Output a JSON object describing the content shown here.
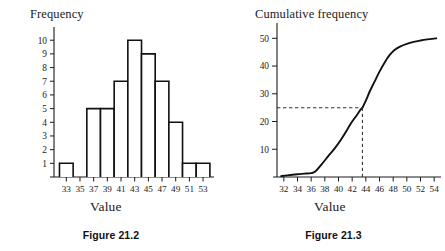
{
  "figures": [
    {
      "caption": "Figure 21.2",
      "chart_data": {
        "type": "bar",
        "title": "Frequency",
        "xlabel": "Value",
        "ylabel": "Frequency",
        "categories": [
          33,
          35,
          37,
          39,
          41,
          43,
          45,
          47,
          49,
          51,
          53
        ],
        "values": [
          1,
          0,
          5,
          5,
          7,
          10,
          9,
          7,
          4,
          1,
          1
        ],
        "xtick_labels": [
          "33",
          "35",
          "37",
          "39",
          "41",
          "43",
          "45",
          "47",
          "49",
          "51",
          "53"
        ],
        "ytick_labels": [
          "1",
          "2",
          "3",
          "4",
          "5",
          "6",
          "7",
          "8",
          "9",
          "10"
        ],
        "ytick_values": [
          1,
          2,
          3,
          4,
          5,
          6,
          7,
          8,
          9,
          10
        ],
        "xlim": [
          31.2,
          54.6
        ],
        "ylim": [
          0,
          10.6
        ],
        "bar_width": 2,
        "grid": false,
        "legend": false,
        "axis_color": "#1a1a1a",
        "bar_fill": "#ffffff",
        "bar_stroke": "#111111"
      }
    },
    {
      "caption": "Figure 21.3",
      "chart_data": {
        "type": "line",
        "title": "Cumulative frequency",
        "xlabel": "Value",
        "ylabel": "Cumulative frequency",
        "xtick_labels": [
          "32",
          "34",
          "36",
          "38",
          "40",
          "42",
          "44",
          "46",
          "48",
          "50",
          "52",
          "54"
        ],
        "xtick_values": [
          32,
          34,
          36,
          38,
          40,
          42,
          44,
          46,
          48,
          50,
          52,
          54
        ],
        "ytick_labels": [
          "10",
          "20",
          "30",
          "40",
          "50"
        ],
        "ytick_values": [
          10,
          20,
          30,
          40,
          50
        ],
        "xlim": [
          31.0,
          55.0
        ],
        "ylim": [
          0,
          53
        ],
        "grid": false,
        "legend": false,
        "axis_color": "#1a1a1a",
        "line_color": "#111111",
        "series": [
          {
            "name": "Cumulative frequency",
            "x": [
              31.6,
              32.5,
              34.0,
              35.0,
              36.0,
              36.6,
              37.5,
              38.5,
              39.5,
              40.5,
              41.5,
              42.0,
              42.6,
              43.2,
              43.5,
              44.0,
              44.6,
              45.3,
              46.0,
              46.8,
              47.5,
              48.2,
              49.0,
              50.0,
              51.0,
              52.0,
              53.0,
              54.3
            ],
            "y": [
              0.3,
              0.6,
              1.0,
              1.2,
              1.4,
              2.0,
              4.5,
              7.5,
              10.5,
              14.0,
              18.0,
              20.0,
              22.0,
              24.2,
              25.0,
              27.5,
              31.0,
              34.5,
              38.0,
              41.5,
              44.0,
              45.8,
              47.0,
              48.0,
              48.7,
              49.2,
              49.6,
              50.0
            ]
          }
        ],
        "annotations": [
          {
            "name": "median-guide",
            "type": "dashed-crosshair",
            "y_value": 25,
            "x_value": 43.5,
            "color": "#333333"
          }
        ]
      }
    }
  ]
}
